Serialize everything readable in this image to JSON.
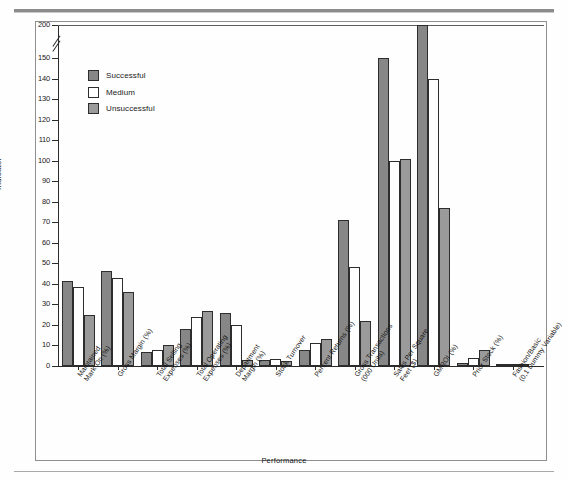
{
  "figure": {
    "y_axis_title": "Indicator",
    "x_axis_title": "Performance"
  },
  "legend": {
    "items": [
      {
        "label": "Successful",
        "color": "#878787",
        "key": "successful"
      },
      {
        "label": "Medium",
        "color": "#ffffff",
        "key": "medium"
      },
      {
        "label": "Unsuccessful",
        "color": "#9a9a9a",
        "key": "unsuccessful"
      }
    ]
  },
  "y_ticks": [
    "200",
    "150",
    "140",
    "130",
    "120",
    "110",
    "100",
    "90",
    "80",
    "70",
    "60",
    "50",
    "40",
    "30",
    "20",
    "10",
    "0"
  ],
  "chart_data": {
    "type": "bar",
    "title": "",
    "xlabel": "Performance",
    "ylabel": "Indicator",
    "ylim": [
      0,
      200
    ],
    "y_axis_break": {
      "between": [
        150,
        200
      ],
      "present": true
    },
    "grid": false,
    "legend_position": "upper-left-inside",
    "categories": [
      "Maintained Mark-On (%)",
      "Gross Margin (%)",
      "Total Selling Expenses (%)",
      "Total Operating Expenses (%)",
      "Department Margin (%)",
      "Stock Turnover",
      "Percent Returns (%)",
      "Gross Transactions (000 Units)",
      "Sales Per Square Feet ($)",
      "GMROI (%)",
      "Prior Stock (%)",
      "Fashion/Basic (0,1 Dummy Variable)"
    ],
    "category_lines": [
      [
        "Maintained",
        "Mark-On (%)"
      ],
      [
        "Gross Margin (%)"
      ],
      [
        "Total Selling",
        "Expenses (%)"
      ],
      [
        "Total Operating",
        "Expenses (%)"
      ],
      [
        "Department",
        "Margin (%)"
      ],
      [
        "Stock Turnover"
      ],
      [
        "Percent Returns (%)"
      ],
      [
        "Gross Transactions",
        "(000 Units)"
      ],
      [
        "Sales Per Square",
        "Feet ($)"
      ],
      [
        "GMROI (%)"
      ],
      [
        "Prior Stock (%)"
      ],
      [
        "Fashion/Basic",
        "(0,1 Dummy Variable)"
      ]
    ],
    "series": [
      {
        "name": "Successful",
        "color": "#878787",
        "values": [
          41.5,
          46.5,
          7.0,
          18.0,
          26.0,
          3.0,
          8.0,
          71.0,
          150.0,
          200.0,
          1.5,
          0.5
        ]
      },
      {
        "name": "Medium",
        "color": "#ffffff",
        "values": [
          38.5,
          43.0,
          8.0,
          24.0,
          20.0,
          3.5,
          11.0,
          48.0,
          100.0,
          140.0,
          4.0,
          0.5
        ]
      },
      {
        "name": "Unsuccessful",
        "color": "#9a9a9a",
        "values": [
          25.0,
          36.0,
          10.0,
          27.0,
          3.0,
          2.5,
          13.0,
          22.0,
          101.0,
          77.0,
          8.0,
          0.5
        ]
      }
    ]
  }
}
